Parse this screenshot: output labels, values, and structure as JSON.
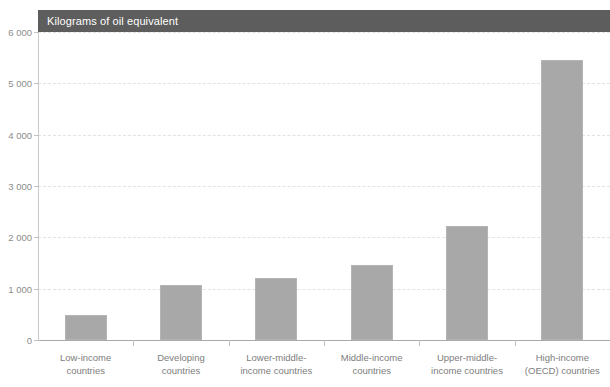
{
  "chart_data": {
    "type": "bar",
    "title": "Kilograms of oil equivalent",
    "xlabel": "",
    "ylabel": "",
    "ylim": [
      0,
      6000
    ],
    "ytick_labels": [
      "6 000",
      "5 000",
      "4 000",
      "3 000",
      "2 000",
      "1 000",
      "0"
    ],
    "ytick_values": [
      6000,
      5000,
      4000,
      3000,
      2000,
      1000,
      0
    ],
    "grid": true,
    "legend": "none",
    "categories": [
      "Low-income countries",
      "Developing countries",
      "Lower-middle-income countries",
      "Middle-income countries",
      "Upper-middle-income countries",
      "High-income (OECD) countries"
    ],
    "category_lines": [
      [
        "Low-income",
        "countries"
      ],
      [
        "Developing",
        "countries"
      ],
      [
        "Lower-middle-",
        "income countries"
      ],
      [
        "Middle-income",
        "countries"
      ],
      [
        "Upper-middle-",
        "income countries"
      ],
      [
        "High-income",
        "(OECD) countries"
      ]
    ],
    "values": [
      480,
      1070,
      1210,
      1470,
      2230,
      5450
    ],
    "colors": {
      "bar_fill": "#a8a8a8",
      "bar_border": "#b4b4b4",
      "title_band": "#5d5d5d",
      "title_text": "#ffffff",
      "axis": "#c2c2c2",
      "gridline": "#e2e2e2",
      "tick_text": "#8c8c8c"
    }
  }
}
